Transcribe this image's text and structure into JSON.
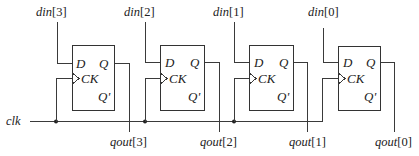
{
  "diagram": {
    "type": "shift-register / parallel-load D flip-flop array",
    "clock_label": "clk",
    "flip_flops": [
      {
        "index": 3,
        "input_label": {
          "name": "din",
          "bit": "[3]"
        },
        "output_label": {
          "name": "qout",
          "bit": "[3]"
        },
        "pins": {
          "d": "D",
          "q": "Q",
          "ck": "CK",
          "qbar": "Q'"
        }
      },
      {
        "index": 2,
        "input_label": {
          "name": "din",
          "bit": "[2]"
        },
        "output_label": {
          "name": "qout",
          "bit": "[2]"
        },
        "pins": {
          "d": "D",
          "q": "Q",
          "ck": "CK",
          "qbar": "Q'"
        }
      },
      {
        "index": 1,
        "input_label": {
          "name": "din",
          "bit": "[1]"
        },
        "output_label": {
          "name": "qout",
          "bit": "[1]"
        },
        "pins": {
          "d": "D",
          "q": "Q",
          "ck": "CK",
          "qbar": "Q'"
        }
      },
      {
        "index": 0,
        "input_label": {
          "name": "din",
          "bit": "[0]"
        },
        "output_label": {
          "name": "qout",
          "bit": "[0]"
        },
        "pins": {
          "d": "D",
          "q": "Q",
          "ck": "CK",
          "qbar": "Q'"
        }
      }
    ],
    "colors": {
      "line": "#3a3a3a",
      "text": "#222222",
      "background": "#ffffff"
    }
  }
}
